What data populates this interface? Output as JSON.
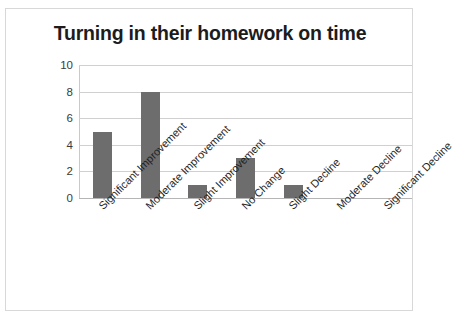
{
  "chart_data": {
    "type": "bar",
    "title": "Turning in their homework on time",
    "xlabel": "",
    "ylabel": "",
    "categories": [
      "Significant Improvement",
      "Moderate Improvement",
      "Slight Improvement",
      "No Change",
      "Slight Decline",
      "Moderate Decline",
      "Significant Decline"
    ],
    "values": [
      5,
      8,
      1,
      3,
      1,
      0,
      0
    ],
    "ylim": [
      0,
      10
    ],
    "yticks": [
      0,
      2,
      4,
      6,
      8,
      10
    ],
    "ytick_labels": [
      "0",
      "2",
      "4",
      "6",
      "8",
      "10"
    ],
    "grid": true,
    "legend": false,
    "legend_position": "none",
    "bar_color": "#6d6d6d",
    "gridline_color": "#d0d0d0",
    "background_color": "#ffffff",
    "border_color": "#d8d8d8",
    "title_color": "#1c1c1c"
  }
}
